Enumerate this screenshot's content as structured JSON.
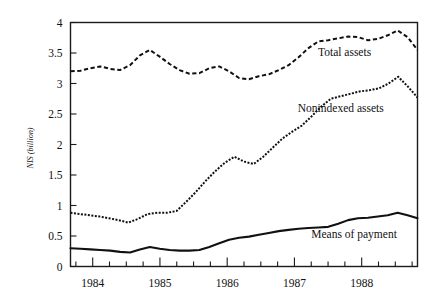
{
  "chart_data": {
    "type": "line",
    "title": "",
    "subtitle": "",
    "xlabel": "",
    "ylabel": "NIS (billion)",
    "xlim": [
      1983.67,
      1988.83
    ],
    "ylim": [
      0,
      4
    ],
    "grid": false,
    "legend_position": "inline-annotations",
    "ytick_labels": [
      "0",
      "0.5",
      "1",
      "1.5",
      "2",
      "2.5",
      "3",
      "3.5",
      "4"
    ],
    "ytick_values": [
      0,
      0.5,
      1,
      1.5,
      2,
      2.5,
      3,
      3.5,
      4
    ],
    "xtick_labels": [
      "1984",
      "1985",
      "1986",
      "1987",
      "1988"
    ],
    "xtick_values": [
      1984,
      1985,
      1986,
      1987,
      1988
    ],
    "x_minor_tick_interval": 0.25,
    "x": [
      1983.67,
      1983.83,
      1984.0,
      1984.17,
      1984.33,
      1984.5,
      1984.67,
      1984.83,
      1985.0,
      1985.17,
      1985.33,
      1985.5,
      1985.67,
      1985.83,
      1986.0,
      1986.17,
      1986.33,
      1986.5,
      1986.67,
      1986.83,
      1987.0,
      1987.17,
      1987.33,
      1987.5,
      1987.67,
      1987.83,
      1988.0,
      1988.17,
      1988.33,
      1988.5,
      1988.67,
      1988.83
    ],
    "series": [
      {
        "name": "Total assets",
        "style": "dashed",
        "values": [
          3.2,
          3.21,
          3.25,
          3.28,
          3.24,
          3.22,
          3.3,
          3.46,
          3.55,
          3.44,
          3.32,
          3.22,
          3.16,
          3.17,
          3.25,
          3.28,
          3.2,
          3.09,
          3.07,
          3.12,
          3.15,
          3.22,
          3.3,
          3.43,
          3.58,
          3.69,
          3.71,
          3.74,
          3.77,
          3.76,
          3.71,
          3.73
        ],
        "label_text": "Total assets"
      },
      {
        "name": "Nonindexed assets",
        "style": "dotted",
        "values": [
          0.88,
          0.86,
          0.84,
          0.82,
          0.79,
          0.76,
          0.72,
          0.78,
          0.86,
          0.88,
          0.88,
          0.91,
          1.06,
          1.22,
          1.4,
          1.56,
          1.7,
          1.8,
          1.72,
          1.68,
          1.8,
          1.95,
          2.1,
          2.21,
          2.31,
          2.46,
          2.62,
          2.75,
          2.79,
          2.83,
          2.87,
          2.89
        ],
        "label_text": "Nonindexed assets"
      },
      {
        "name": "Means of payment",
        "style": "solid",
        "values": [
          0.3,
          0.29,
          0.28,
          0.27,
          0.26,
          0.24,
          0.23,
          0.28,
          0.32,
          0.29,
          0.27,
          0.26,
          0.26,
          0.27,
          0.32,
          0.38,
          0.44,
          0.47,
          0.49,
          0.52,
          0.55,
          0.58,
          0.6,
          0.62,
          0.63,
          0.64,
          0.65,
          0.7,
          0.76,
          0.79,
          0.8,
          0.82
        ],
        "label_text": "Means of payment"
      }
    ],
    "series_tail": {
      "note": "final segment of each series extends to right edge",
      "total_assets_end": [
        3.79,
        3.87,
        3.76,
        3.55
      ],
      "nonindexed_end": [
        2.92,
        3.0,
        3.11,
        2.95,
        2.77
      ],
      "means_of_payment_end": [
        0.84,
        0.88,
        0.84,
        0.79
      ]
    },
    "annotations": [
      {
        "text": "Total assets",
        "x": 1987.35,
        "y": 3.45
      },
      {
        "text": "Nonindexed assets",
        "x": 1987.05,
        "y": 2.53
      },
      {
        "text": "Means of payment",
        "x": 1987.25,
        "y": 0.46
      }
    ]
  },
  "axis": {
    "y_title": "NIS (billion)"
  }
}
